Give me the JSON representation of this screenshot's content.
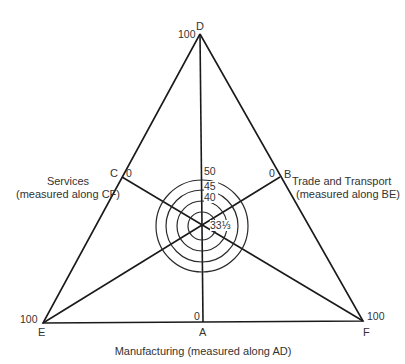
{
  "diagram": {
    "type": "triangular diagram",
    "vertices": {
      "D": {
        "label": "D",
        "value": "100"
      },
      "E": {
        "label": "E",
        "value": "100"
      },
      "F": {
        "label": "F",
        "value": "100"
      },
      "A": {
        "label": "A",
        "value": "0"
      },
      "B": {
        "label": "B",
        "value": "0"
      },
      "C": {
        "label": "C",
        "value": "0"
      }
    },
    "axes": {
      "services": {
        "line1": "Services",
        "line2": "(measured along CF)"
      },
      "trade": {
        "line1": "Trade and Transport",
        "line2": "(measured along BE)"
      },
      "manufacturing": {
        "label": "Manufacturing (measured along AD)"
      }
    },
    "circle_labels": [
      "50",
      "45",
      "40",
      "33⅓"
    ]
  }
}
